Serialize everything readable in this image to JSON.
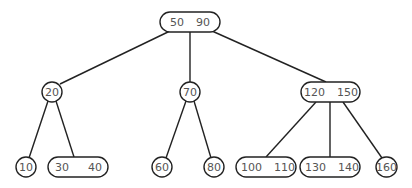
{
  "diagram": {
    "type": "B-tree (2-3 tree)",
    "root": {
      "keys": [
        "50",
        "90"
      ]
    },
    "level1": [
      {
        "keys": [
          "20"
        ]
      },
      {
        "keys": [
          "70"
        ]
      },
      {
        "keys": [
          "120",
          "150"
        ]
      }
    ],
    "leaves": [
      {
        "keys": [
          "10"
        ]
      },
      {
        "keys": [
          "30",
          "40"
        ]
      },
      {
        "keys": [
          "60"
        ]
      },
      {
        "keys": [
          "80"
        ]
      },
      {
        "keys": [
          "100",
          "110"
        ]
      },
      {
        "keys": [
          "130",
          "140"
        ]
      },
      {
        "keys": [
          "160"
        ]
      }
    ],
    "colors": {
      "stroke": "#222222",
      "text": "#555555",
      "background": "#ffffff"
    }
  }
}
